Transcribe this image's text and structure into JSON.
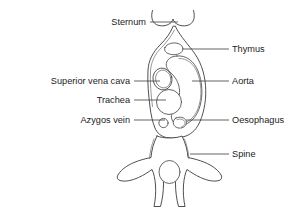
{
  "figure": {
    "type": "anatomical-line-diagram",
    "background_color": "#ffffff",
    "line_color": "#3b3b3b",
    "text_color": "#1c1c1c"
  },
  "labels": {
    "sternum": "Sternum",
    "thymus": "Thymus",
    "superior_vena_cava": "Superior vena cava",
    "aorta": "Aorta",
    "trachea": "Trachea",
    "azygos_vein": "Azygos vein",
    "oesophagus": "Oesophagus",
    "spine": "Spine"
  },
  "label_positions": {
    "sternum": {
      "x": 146,
      "y": 25,
      "side": "left"
    },
    "thymus": {
      "x": 232,
      "y": 52,
      "side": "right"
    },
    "superior_vena_cava": {
      "x": 130,
      "y": 84,
      "side": "left"
    },
    "aorta": {
      "x": 232,
      "y": 84,
      "side": "right"
    },
    "trachea": {
      "x": 130,
      "y": 103,
      "side": "left"
    },
    "azygos_vein": {
      "x": 130,
      "y": 123,
      "side": "left"
    },
    "oesophagus": {
      "x": 232,
      "y": 123,
      "side": "right"
    },
    "spine": {
      "x": 232,
      "y": 157,
      "side": "right"
    }
  },
  "leader_lines": {
    "sternum": {
      "x1": 150,
      "y1": 22,
      "x2": 178,
      "y2": 22
    },
    "thymus": {
      "x1": 182,
      "y1": 49,
      "x2": 229,
      "y2": 49
    },
    "superior_vena_cava": {
      "x1": 134,
      "y1": 81,
      "x2": 160,
      "y2": 81
    },
    "aorta": {
      "x1": 192,
      "y1": 81,
      "x2": 229,
      "y2": 81
    },
    "trachea": {
      "x1": 134,
      "y1": 100,
      "x2": 166,
      "y2": 100
    },
    "azygos_vein": {
      "x1": 134,
      "y1": 120,
      "x2": 165,
      "y2": 120
    },
    "oesophagus": {
      "x1": 186,
      "y1": 120,
      "x2": 229,
      "y2": 120
    },
    "spine": {
      "x1": 190,
      "y1": 154,
      "x2": 229,
      "y2": 154
    }
  },
  "structures": [
    {
      "name": "sternum",
      "shape": "bilobed-cap"
    },
    {
      "name": "mediastinum-body",
      "shape": "tapered-outline"
    },
    {
      "name": "thymus",
      "shape": "small-lobe"
    },
    {
      "name": "superior-vena-cava",
      "shape": "oval"
    },
    {
      "name": "aorta",
      "shape": "large-comma"
    },
    {
      "name": "trachea",
      "shape": "circle"
    },
    {
      "name": "azygos-vein",
      "shape": "small-circle"
    },
    {
      "name": "oesophagus",
      "shape": "rounded-lobe"
    },
    {
      "name": "vertebra",
      "shape": "winged-body"
    },
    {
      "name": "spinal-canal",
      "shape": "oval"
    }
  ]
}
